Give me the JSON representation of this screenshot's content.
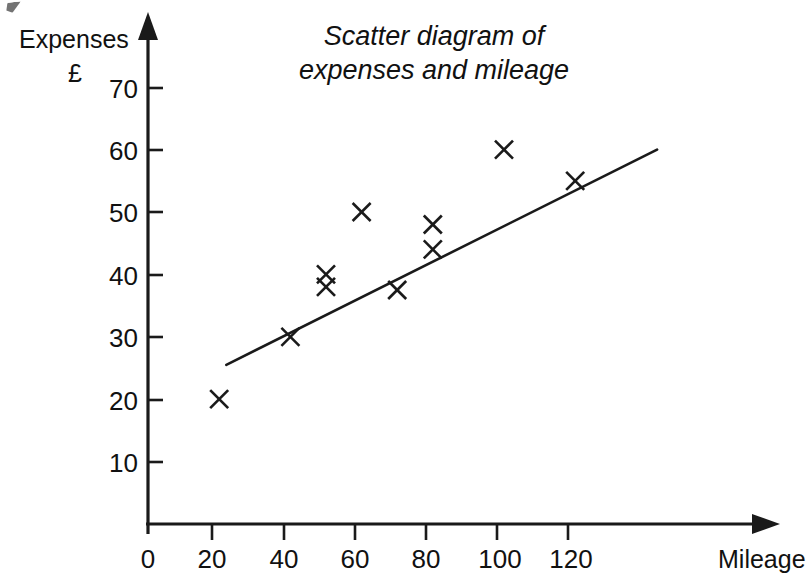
{
  "chart_data": {
    "type": "scatter",
    "title": "Scatter diagram of expenses and mileage",
    "title_line_1": "Scatter diagram of",
    "title_line_2": "expenses and mileage",
    "xlabel": "Mileage",
    "ylabel": "Expenses",
    "ylabel_unit": "£",
    "xlim": [
      0,
      140
    ],
    "ylim": [
      0,
      76
    ],
    "grid": false,
    "legend": null,
    "x_ticks": [
      0,
      20,
      40,
      60,
      80,
      100,
      120
    ],
    "y_ticks": [
      10,
      20,
      30,
      40,
      50,
      60,
      70
    ],
    "x_tick_labels": [
      "0",
      "20",
      "40",
      "60",
      "80",
      "100",
      "120"
    ],
    "y_tick_labels": [
      "10",
      "20",
      "30",
      "40",
      "50",
      "60",
      "70"
    ],
    "marker": "x",
    "marker_color": "#1a1a1a",
    "points": [
      {
        "x": 20,
        "y": 20
      },
      {
        "x": 40,
        "y": 30
      },
      {
        "x": 50,
        "y": 40
      },
      {
        "x": 50,
        "y": 38
      },
      {
        "x": 60,
        "y": 50
      },
      {
        "x": 70,
        "y": 37.5
      },
      {
        "x": 80,
        "y": 48
      },
      {
        "x": 80,
        "y": 44
      },
      {
        "x": 100,
        "y": 60
      },
      {
        "x": 120,
        "y": 55
      }
    ],
    "trend_line": {
      "label": "line of best fit",
      "x_start": 22,
      "y_start": 25.5,
      "x_end": 143,
      "y_end": 60,
      "color": "#1a1a1a"
    }
  },
  "axes": {
    "y_axis_name": "expenses-axis",
    "x_axis_name": "mileage-axis"
  }
}
